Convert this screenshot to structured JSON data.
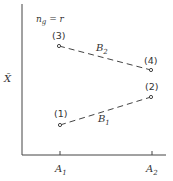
{
  "diagram": {
    "y_axis_label": "X̄",
    "x_ticks": [
      {
        "main": "A",
        "sub": "1"
      },
      {
        "main": "A",
        "sub": "2"
      }
    ],
    "annotation": {
      "main": "n",
      "sub": "g",
      "rest": " = r"
    },
    "points": [
      {
        "label": "(1)",
        "x": 60,
        "y": 125
      },
      {
        "label": "(2)",
        "x": 151,
        "y": 97
      },
      {
        "label": "(3)",
        "x": 59,
        "y": 46
      },
      {
        "label": "(4)",
        "x": 151,
        "y": 70
      }
    ],
    "lines": [
      {
        "name": "B",
        "sub": "1",
        "from": "(1)",
        "to": "(2)"
      },
      {
        "name": "B",
        "sub": "2",
        "from": "(3)",
        "to": "(4)"
      }
    ],
    "colors": {
      "ink": "#333333",
      "background": "#ffffff"
    }
  }
}
